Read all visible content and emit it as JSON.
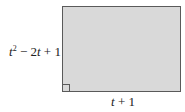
{
  "diagram": {
    "shape": "rectangle",
    "fill_color": "#d9d9d9",
    "border_color": "#5a5a5a",
    "right_angle_marker": "bottom-left",
    "height_label": {
      "variable": "t",
      "exponent": "2",
      "rest": " − 2",
      "variable2": "t",
      "tail": " + 1",
      "full_text": "t^2 − 2t + 1"
    },
    "width_label": {
      "variable": "t",
      "tail": " + 1",
      "full_text": "t + 1"
    }
  }
}
